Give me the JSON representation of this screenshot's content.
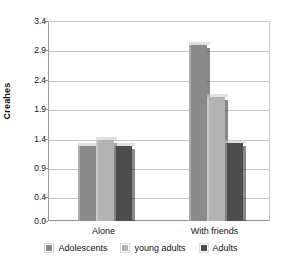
{
  "chart_data": {
    "type": "bar",
    "title": "",
    "xlabel": "",
    "ylabel": "Creahes",
    "categories": [
      "Alone",
      "With friends"
    ],
    "series": [
      {
        "name": "Adolescents",
        "color": "#8a8a8a",
        "values": [
          1.28,
          3.0
        ]
      },
      {
        "name": "young adults",
        "color": "#b3b3b3",
        "values": [
          1.37,
          2.1
        ]
      },
      {
        "name": "Adults",
        "color": "#4d4d4d",
        "values": [
          1.27,
          1.32
        ]
      }
    ],
    "ylim": [
      0.0,
      3.4
    ],
    "yticks": [
      "0.0",
      "0.4",
      "0.9",
      "1.4",
      "1.9",
      "2.4",
      "2.9",
      "3.4"
    ],
    "ytick_values": [
      0.0,
      0.4,
      0.9,
      1.4,
      1.9,
      2.4,
      2.9,
      3.4
    ],
    "grid": true,
    "legend_position": "bottom"
  },
  "axis": {
    "y_title": "Creahes"
  },
  "legend": {
    "items": [
      {
        "label": "Adolescents"
      },
      {
        "label": "young adults"
      },
      {
        "label": "Adults"
      }
    ]
  }
}
